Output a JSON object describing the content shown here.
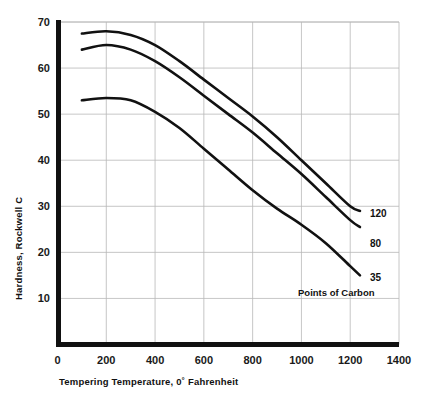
{
  "chart_data": {
    "type": "line",
    "title": "",
    "xlabel": "Tempering Temperature, 0˚ Fahrenheit",
    "ylabel": "Hardness, Rockwell C",
    "xlim": [
      0,
      1400
    ],
    "ylim": [
      0,
      70
    ],
    "xticks": [
      0,
      200,
      400,
      600,
      800,
      1000,
      1200,
      1400
    ],
    "xticklabels": [
      "0",
      "200",
      "400",
      "600",
      "800",
      "1000",
      "1200",
      "1400"
    ],
    "yticks": [
      10,
      20,
      30,
      40,
      50,
      60,
      70
    ],
    "yticklabels": [
      "10",
      "20",
      "30",
      "40",
      "50",
      "60",
      "70"
    ],
    "grid": true,
    "legend_position": "right-inline",
    "legend_caption": "Points of Carbon",
    "series": [
      {
        "name": "120",
        "label": "120",
        "color": "#111111",
        "x": [
          100,
          200,
          300,
          400,
          500,
          600,
          700,
          800,
          900,
          1000,
          1100,
          1200,
          1240
        ],
        "y": [
          67.5,
          68.0,
          67.2,
          65.0,
          61.5,
          57.5,
          53.5,
          49.5,
          45.0,
          40.0,
          35.0,
          30.0,
          29.0
        ]
      },
      {
        "name": "80",
        "label": "80",
        "color": "#111111",
        "x": [
          100,
          200,
          300,
          400,
          500,
          600,
          700,
          800,
          900,
          1000,
          1100,
          1200,
          1240
        ],
        "y": [
          64.0,
          65.0,
          64.0,
          61.5,
          58.0,
          54.0,
          50.0,
          46.0,
          41.5,
          37.0,
          32.0,
          27.0,
          25.5
        ]
      },
      {
        "name": "35",
        "label": "35",
        "color": "#111111",
        "x": [
          100,
          200,
          300,
          400,
          500,
          600,
          700,
          800,
          900,
          1000,
          1100,
          1200,
          1240
        ],
        "y": [
          53.0,
          53.5,
          53.0,
          50.5,
          47.0,
          42.5,
          38.0,
          33.5,
          29.5,
          26.0,
          22.0,
          17.0,
          15.0
        ]
      }
    ]
  },
  "axes": {
    "y_axis_title": "Hardness, Rockwell C",
    "x_axis_title": "Tempering Temperature, 0˚ Fahrenheit"
  },
  "annotations": {
    "points_of_carbon": "Points of Carbon"
  }
}
